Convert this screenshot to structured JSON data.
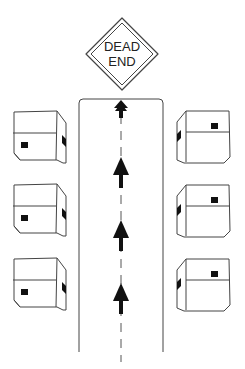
{
  "sign": {
    "line1": "DEAD",
    "line2": "END",
    "shape": "diamond"
  },
  "road": {
    "direction": "up",
    "arrows": 4,
    "center_line": "dashed"
  },
  "houses": {
    "left": 3,
    "right": 3
  },
  "caption": {
    "text": ""
  },
  "colors": {
    "stroke": "#333333",
    "fill": "#ffffff",
    "marker": "#111111"
  }
}
